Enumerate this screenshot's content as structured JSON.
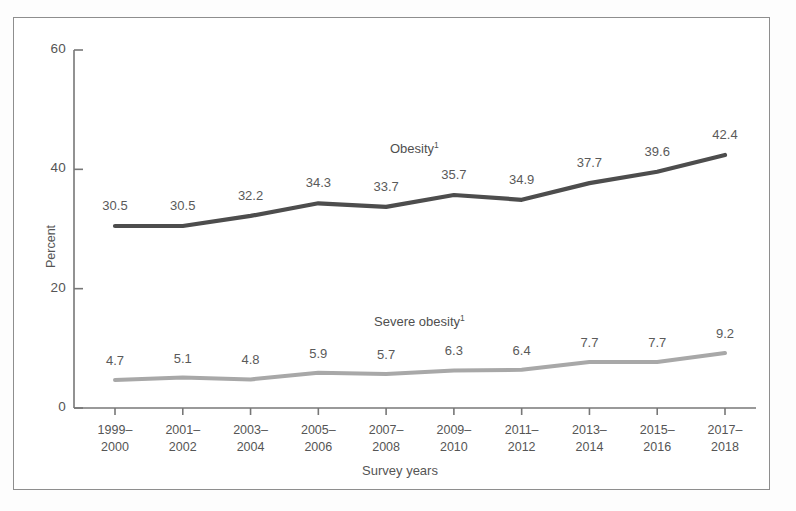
{
  "figure": {
    "y_axis_title": "Percent",
    "x_axis_title": "Survey years",
    "y_ticks": [
      "0",
      "20",
      "40",
      "60"
    ],
    "series_labels": {
      "obesity": "Obesity",
      "obesity_footnote": "1",
      "severe_obesity": "Severe obesity",
      "severe_obesity_footnote": "1"
    },
    "colors": {
      "obesity_line": "#4d4d4d",
      "severe_obesity_line": "#a8a8a8",
      "axis": "#777777",
      "text": "#555555",
      "border": "#8e8e8e",
      "background": "#ffffff"
    }
  },
  "chart_data": {
    "type": "line",
    "title": "",
    "xlabel": "Survey years",
    "ylabel": "Percent",
    "ylim": [
      0,
      60
    ],
    "yticks": [
      0,
      20,
      40,
      60
    ],
    "grid": false,
    "legend": "inline-annotations",
    "categories": [
      "1999–\n2000",
      "2001–\n2002",
      "2003–\n2004",
      "2005–\n2006",
      "2007–\n2008",
      "2009–\n2010",
      "2011–\n2012",
      "2013–\n2014",
      "2015–\n2016",
      "2017–\n2018"
    ],
    "series": [
      {
        "name": "Obesity",
        "values": [
          30.5,
          30.5,
          32.2,
          34.3,
          33.7,
          35.7,
          34.9,
          37.7,
          39.6,
          42.4
        ],
        "labels": [
          "30.5",
          "30.5",
          "32.2",
          "34.3",
          "33.7",
          "35.7",
          "34.9",
          "37.7",
          "39.6",
          "42.4"
        ],
        "color": "#4d4d4d"
      },
      {
        "name": "Severe obesity",
        "values": [
          4.7,
          5.1,
          4.8,
          5.9,
          5.7,
          6.3,
          6.4,
          7.7,
          7.7,
          9.2
        ],
        "labels": [
          "4.7",
          "5.1",
          "4.8",
          "5.9",
          "5.7",
          "6.3",
          "6.4",
          "7.7",
          "7.7",
          "9.2"
        ],
        "color": "#a8a8a8"
      }
    ]
  }
}
